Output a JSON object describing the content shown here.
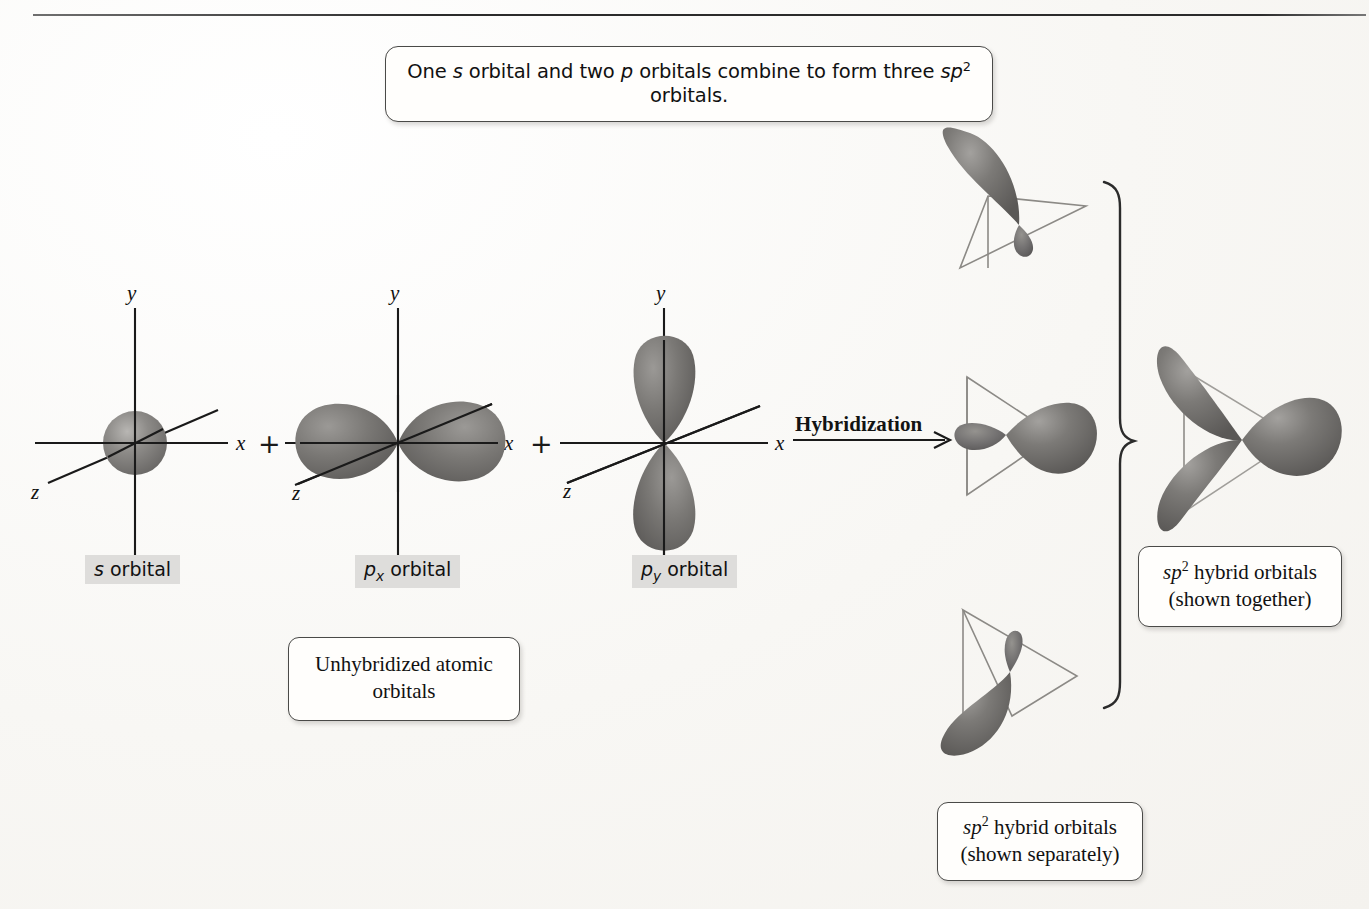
{
  "figure": {
    "title_caption": "One s orbital and two p orbitals combine to form three sp2 orbitals.",
    "background_color": "#f8f7f4",
    "orbital_fill": "#6e6d6b",
    "line_color": "#1a1a1a"
  },
  "caption": {
    "part1": "One ",
    "s_italic": "s",
    "part2": " orbital and two ",
    "p_italic": "p",
    "part3": " orbitals combine to form three ",
    "sp_italic": "sp",
    "sp_exponent": "2",
    "part4": " orbitals."
  },
  "atomic_orbitals": [
    {
      "id": "s-orbital",
      "label_prefix": "s",
      "label_suffix": " orbital",
      "axes": {
        "x": "x",
        "y": "y",
        "z": "z"
      },
      "shape": "sphere"
    },
    {
      "id": "px-orbital",
      "label_prefix": "p",
      "label_subscript": "x",
      "label_suffix": " orbital",
      "axes": {
        "x": "x",
        "y": "y",
        "z": "z"
      },
      "shape": "horizontal-dumbbell"
    },
    {
      "id": "py-orbital",
      "label_prefix": "p",
      "label_subscript": "y",
      "label_suffix": " orbital",
      "axes": {
        "x": "x",
        "y": "y",
        "z": "z"
      },
      "shape": "vertical-dumbbell"
    }
  ],
  "operators": {
    "plus_1": "+",
    "plus_2": "+"
  },
  "arrow": {
    "label": "Hybridization",
    "direction": "right"
  },
  "boxes": {
    "unhybridized": {
      "line1": "Unhybridized atomic",
      "line2": "orbitals"
    },
    "shown_together": {
      "sp": "sp",
      "exponent": "2",
      "line1_rest": " hybrid orbitals",
      "line2": "(shown together)"
    },
    "shown_separately": {
      "sp": "sp",
      "exponent": "2",
      "line1_rest": " hybrid orbitals",
      "line2": "(shown separately)"
    }
  },
  "hybrid_orbitals": {
    "separate_count": 3,
    "separate_directions": [
      "up-left",
      "right",
      "down-left"
    ],
    "combined_description": "three lobes at 120 degrees over a triangle",
    "brace": "right-curly-brace"
  }
}
